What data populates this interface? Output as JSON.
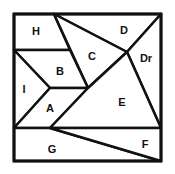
{
  "diagram": {
    "type": "dissection-puzzle",
    "stroke_color": "#111111",
    "background": "#ffffff",
    "pieces": [
      {
        "id": "H",
        "label": "H",
        "points": [
          [
            14,
            14
          ],
          [
            54,
            14
          ],
          [
            70,
            50
          ],
          [
            14,
            50
          ]
        ],
        "label_pos": [
          36,
          35
        ]
      },
      {
        "id": "D",
        "label": "D",
        "points": [
          [
            54,
            14
          ],
          [
            161,
            14
          ],
          [
            127,
            52
          ]
        ],
        "label_pos": [
          124,
          34
        ]
      },
      {
        "id": "C",
        "label": "C",
        "points": [
          [
            54,
            14
          ],
          [
            127,
            52
          ],
          [
            88,
            88
          ]
        ],
        "label_pos": [
          92,
          60
        ]
      },
      {
        "id": "Dr",
        "label": "Dr",
        "points": [
          [
            161,
            14
          ],
          [
            161,
            128
          ],
          [
            127,
            52
          ]
        ],
        "label_pos": [
          146,
          62
        ]
      },
      {
        "id": "B",
        "label": "B",
        "points": [
          [
            14,
            50
          ],
          [
            70,
            50
          ],
          [
            88,
            88
          ],
          [
            50,
            88
          ]
        ],
        "label_pos": [
          60,
          75
        ]
      },
      {
        "id": "I",
        "label": "I",
        "points": [
          [
            14,
            50
          ],
          [
            50,
            88
          ],
          [
            14,
            128
          ]
        ],
        "label_pos": [
          24,
          93
        ]
      },
      {
        "id": "A",
        "label": "A",
        "points": [
          [
            50,
            88
          ],
          [
            88,
            88
          ],
          [
            50,
            128
          ],
          [
            14,
            128
          ]
        ],
        "label_pos": [
          50,
          112
        ]
      },
      {
        "id": "E",
        "label": "E",
        "points": [
          [
            127,
            52
          ],
          [
            161,
            128
          ],
          [
            50,
            128
          ],
          [
            88,
            88
          ]
        ],
        "label_pos": [
          122,
          106
        ]
      },
      {
        "id": "G",
        "label": "G",
        "points": [
          [
            14,
            128
          ],
          [
            50,
            128
          ],
          [
            161,
            161
          ],
          [
            14,
            161
          ]
        ],
        "label_pos": [
          52,
          153
        ]
      },
      {
        "id": "F",
        "label": "F",
        "points": [
          [
            50,
            128
          ],
          [
            161,
            128
          ],
          [
            161,
            161
          ]
        ],
        "label_pos": [
          145,
          148
        ]
      }
    ]
  }
}
